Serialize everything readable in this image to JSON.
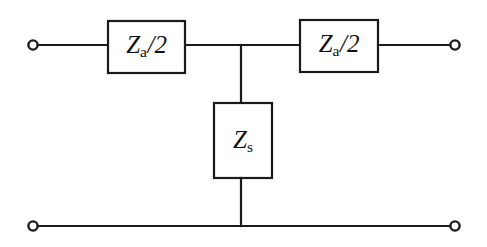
{
  "figure": {
    "background_color": "#ffffff",
    "line_color": "#1a1a1a",
    "width": 487,
    "height": 247
  },
  "components": {
    "series_left": {
      "name": "series-impedance-left",
      "symbol_var": "Z",
      "symbol_sub": "a",
      "symbol_slash": "/",
      "symbol_num": "2",
      "label_full": "Za/2"
    },
    "series_right": {
      "name": "series-impedance-right",
      "symbol_var": "Z",
      "symbol_sub": "a",
      "symbol_slash": "/",
      "symbol_num": "2",
      "label_full": "Za/2"
    },
    "shunt": {
      "name": "shunt-impedance",
      "symbol_var": "Z",
      "symbol_sub": "s",
      "label_full": "Zs"
    }
  },
  "terminals": [
    {
      "name": "input-terminal-top",
      "x": 33,
      "y": 45
    },
    {
      "name": "output-terminal-top",
      "x": 455,
      "y": 45
    },
    {
      "name": "input-terminal-bottom",
      "x": 33,
      "y": 226
    },
    {
      "name": "output-terminal-bottom",
      "x": 455,
      "y": 226
    }
  ],
  "nodes": {
    "top_junction": {
      "name": "top-junction",
      "x": 241,
      "y": 45
    },
    "bottom_junction": {
      "name": "bottom-junction",
      "x": 241,
      "y": 226
    }
  }
}
